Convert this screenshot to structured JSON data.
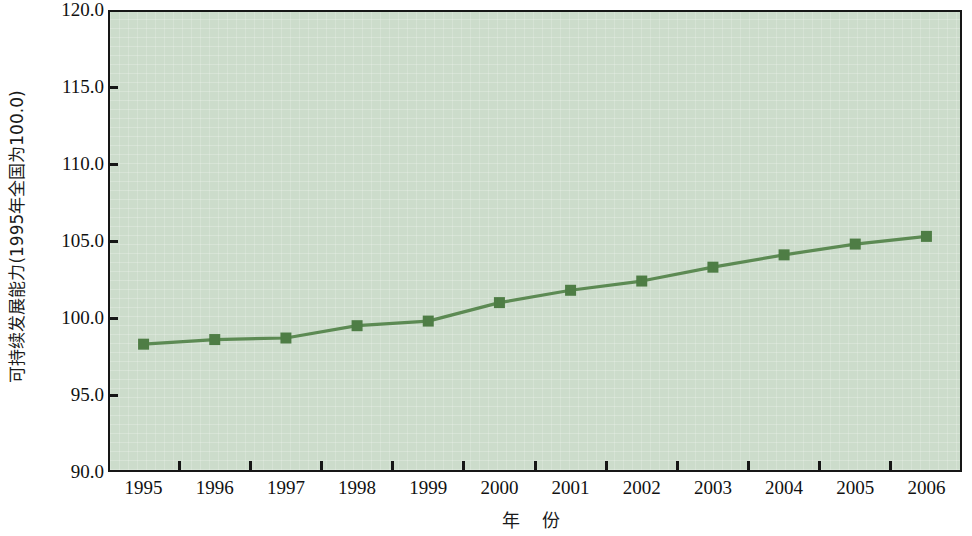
{
  "chart_data": {
    "type": "line",
    "title": "",
    "subtitle": "",
    "xlabel": "年  份",
    "ylabel": "可持续发展能力(1995年全国为100.0)",
    "categories": [
      "1995",
      "1996",
      "1997",
      "1998",
      "1999",
      "2000",
      "2001",
      "2002",
      "2003",
      "2004",
      "2005",
      "2006"
    ],
    "x": [
      1995,
      1996,
      1997,
      1998,
      1999,
      2000,
      2001,
      2002,
      2003,
      2004,
      2005,
      2006
    ],
    "series": [
      {
        "name": "可持续发展能力",
        "values": [
          98.3,
          98.6,
          98.7,
          99.5,
          99.8,
          101.0,
          101.8,
          102.4,
          103.3,
          104.1,
          104.8,
          105.3
        ]
      }
    ],
    "ylim": [
      90.0,
      120.0
    ],
    "ytick_labels": [
      "120.0",
      "115.0",
      "110.0",
      "105.0",
      "100.0",
      "95.0",
      "90.0"
    ],
    "ytick_values": [
      120.0,
      115.0,
      110.0,
      105.0,
      100.0,
      95.0,
      90.0
    ],
    "grid": false,
    "legend": "none",
    "marker": "square",
    "colors": {
      "line": "#5c8a53",
      "marker": "#4e7d45",
      "plot_background": "#ccdccb",
      "axis": "#161616",
      "text": "#111111"
    }
  }
}
